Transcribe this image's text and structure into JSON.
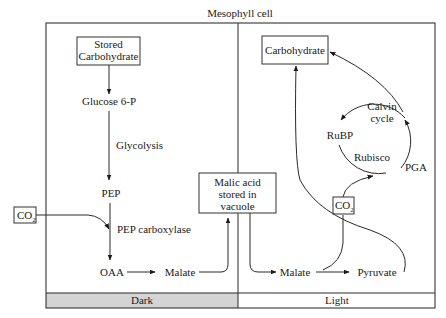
{
  "diagram": {
    "title": "Mesophyll cell",
    "type": "CAM photosynthesis pathway",
    "panels": {
      "dark": {
        "label": "Dark",
        "color": "#d4d4d4",
        "nodes": {
          "stored_carbohydrate_line1": "Stored",
          "stored_carbohydrate_line2": "Carbohydrate",
          "glucose6p": "Glucose 6-P",
          "glycolysis": "Glycolysis",
          "pep": "PEP",
          "co2": "CO",
          "co2_sub": "2",
          "pep_carboxylase": "PEP carboxylase",
          "oaa": "OAA",
          "malate": "Malate"
        }
      },
      "center": {
        "malic_acid_line1": "Malic acid",
        "malic_acid_line2": "stored in",
        "malic_acid_line3": "vacuole"
      },
      "light": {
        "label": "Light",
        "color": "#ffffff",
        "nodes": {
          "carbohydrate": "Carbohydrate",
          "calvin_line1": "Calvin",
          "calvin_line2": "cycle",
          "rubp": "RuBP",
          "rubisco": "Rubisco",
          "pga": "PGA",
          "co2": "CO",
          "co2_sub": "2",
          "malate": "Malate",
          "pyruvate": "Pyruvate"
        }
      }
    },
    "edges": [
      {
        "from": "Stored Carbohydrate",
        "to": "Glucose 6-P"
      },
      {
        "from": "Glucose 6-P",
        "to": "PEP",
        "label": "Glycolysis"
      },
      {
        "from": "PEP",
        "to": "OAA",
        "label": "PEP carboxylase"
      },
      {
        "from": "CO2",
        "to": "PEP carboxylase step"
      },
      {
        "from": "OAA",
        "to": "Malate"
      },
      {
        "from": "Malate",
        "to": "Malic acid stored in vacuole"
      },
      {
        "from": "Malic acid stored in vacuole",
        "to": "Malate (light)"
      },
      {
        "from": "Malate (light)",
        "to": "Pyruvate"
      },
      {
        "from": "Malate (light)",
        "to": "CO2 (light)"
      },
      {
        "from": "CO2 (light)",
        "to": "PGA"
      },
      {
        "from": "PGA",
        "to": "Carbohydrate"
      },
      {
        "from": "Calvin cycle",
        "to": "RuBP"
      },
      {
        "from": "Pyruvate",
        "to": "Carbohydrate"
      }
    ]
  }
}
